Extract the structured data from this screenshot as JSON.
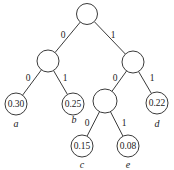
{
  "diagram": {
    "type": "binary-code-tree",
    "nodes": [
      {
        "id": "root",
        "x": 87,
        "y": 14,
        "r": 10.5,
        "value": ""
      },
      {
        "id": "n0",
        "x": 48,
        "y": 61,
        "r": 11,
        "value": ""
      },
      {
        "id": "n1",
        "x": 133,
        "y": 62,
        "r": 11,
        "value": ""
      },
      {
        "id": "a",
        "x": 16,
        "y": 104,
        "r": 11,
        "value": "0.30",
        "symbol": "a",
        "sx": 16,
        "sy": 123
      },
      {
        "id": "b",
        "x": 73,
        "y": 104,
        "r": 11,
        "value": "0.25",
        "symbol": "b",
        "sx": 74,
        "sy": 119
      },
      {
        "id": "n10",
        "x": 105,
        "y": 101,
        "r": 12,
        "value": ""
      },
      {
        "id": "d",
        "x": 157,
        "y": 103,
        "r": 11,
        "value": "0.22",
        "symbol": "d",
        "sx": 157,
        "sy": 123
      },
      {
        "id": "c",
        "x": 82,
        "y": 146,
        "r": 11,
        "value": "0.15",
        "symbol": "c",
        "sx": 82,
        "sy": 164
      },
      {
        "id": "e",
        "x": 128,
        "y": 146,
        "r": 11,
        "value": "0.08",
        "symbol": "e",
        "sx": 128,
        "sy": 164
      }
    ],
    "edges": [
      {
        "from": "root",
        "to": "n0",
        "label": "0",
        "lx": 63,
        "ly": 35
      },
      {
        "from": "root",
        "to": "n1",
        "label": "1",
        "lx": 113,
        "ly": 35
      },
      {
        "from": "n0",
        "to": "a",
        "label": "0",
        "lx": 28,
        "ly": 78
      },
      {
        "from": "n0",
        "to": "b",
        "label": "1",
        "lx": 65,
        "ly": 78
      },
      {
        "from": "n1",
        "to": "n10",
        "label": "0",
        "lx": 115,
        "ly": 78
      },
      {
        "from": "n1",
        "to": "d",
        "label": "1",
        "lx": 152,
        "ly": 78
      },
      {
        "from": "n10",
        "to": "c",
        "label": "0",
        "lx": 87,
        "ly": 123
      },
      {
        "from": "n10",
        "to": "e",
        "label": "1",
        "lx": 124,
        "ly": 123
      }
    ]
  }
}
